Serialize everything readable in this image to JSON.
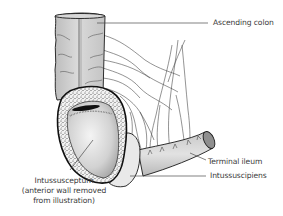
{
  "figure": {
    "labels": {
      "ascending_colon": "Ascending colon",
      "terminal_ileum": "Terminal ileum",
      "intussuscipiens": "Intussuscipiens",
      "intussusceptum_line1": "Intussusceptum",
      "intussusceptum_line2": "(anterior wall removed",
      "intussusceptum_line3": "from illustration)"
    },
    "colors": {
      "outline": "#1a1a1a",
      "bowel_fill": "#cfcfcf",
      "bowel_light": "#e8e8e8",
      "speckle_wall": "#f2f2f2",
      "leader_line": "#4a4a4a",
      "text": "#3a3a3a"
    }
  }
}
